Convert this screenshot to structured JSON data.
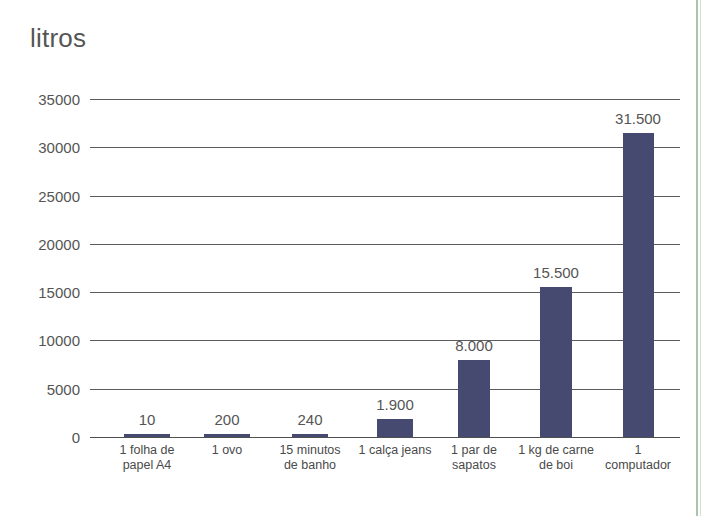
{
  "chart_data": {
    "type": "bar",
    "title": "litros",
    "xlabel": "",
    "ylabel": "litros",
    "ylim": [
      0,
      35000
    ],
    "ytick_values": [
      0,
      5000,
      10000,
      15000,
      20000,
      25000,
      30000,
      35000
    ],
    "ytick_labels": [
      "0",
      "5000",
      "10000",
      "15000",
      "20000",
      "25000",
      "30000",
      "35000"
    ],
    "grid": true,
    "legend": "none",
    "bar_color": "#474a70",
    "categories": [
      "1 folha de\npapel A4",
      "1 ovo",
      "15 minutos\nde banho",
      "1 calça jeans",
      "1 par de\nsapatos",
      "1 kg de carne\nde boi",
      "1 computador"
    ],
    "values": [
      10,
      200,
      240,
      1900,
      8000,
      15500,
      31500
    ],
    "value_labels": [
      "10",
      "200",
      "240",
      "1.900",
      "8.000",
      "15.500",
      "31.500"
    ],
    "bar_centers_px": [
      147,
      227,
      310,
      395,
      474,
      556,
      638
    ],
    "bar_width_px": [
      46,
      46,
      36,
      36,
      32,
      32,
      31
    ]
  }
}
